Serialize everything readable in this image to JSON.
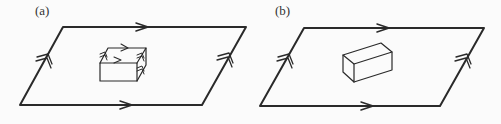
{
  "panels": [
    {
      "label": "(a)",
      "label_pos": [
        35,
        3
      ],
      "surface": {
        "top_left": [
          63,
          27
        ],
        "top_right": [
          246,
          27
        ],
        "bottom_right": [
          202,
          105
        ],
        "bottom_left": [
          20,
          105
        ]
      },
      "box": {
        "description": "rectangular box with arrowed edges on top and sides"
      },
      "edge_markers": {
        "top": "single-arrow",
        "bottom": "single-arrow",
        "left": "double-arrow",
        "right": "double-arrow"
      }
    },
    {
      "label": "(b)",
      "label_pos": [
        275,
        3
      ],
      "surface": {
        "top_left": [
          304,
          28
        ],
        "top_right": [
          484,
          28
        ],
        "bottom_right": [
          440,
          106
        ],
        "bottom_left": [
          260,
          106
        ]
      },
      "box": {
        "description": "plain rectangular box without arrows"
      },
      "edge_markers": {
        "top": "single-arrow",
        "bottom": "single-arrow",
        "left": "double-arrow",
        "right": "double-arrow"
      }
    }
  ],
  "colors": {
    "stroke": "#2a2a2a",
    "background": "#fbfbfb",
    "label": "#333333"
  }
}
